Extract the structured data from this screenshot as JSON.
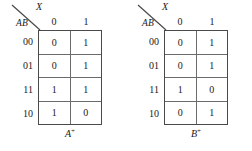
{
  "figure": {
    "background_color": "#ffffff",
    "line_color": "#4a4a4a"
  },
  "maps": [
    {
      "id": "a-next",
      "corner": {
        "column_var": "X",
        "row_var": "AB"
      },
      "column_headers": [
        "0",
        "1"
      ],
      "row_labels": [
        "00",
        "01",
        "11",
        "10"
      ],
      "rows": [
        [
          "0",
          "1"
        ],
        [
          "0",
          "1"
        ],
        [
          "1",
          "1"
        ],
        [
          "1",
          "0"
        ]
      ],
      "caption": {
        "base": "A",
        "superscript": "+"
      }
    },
    {
      "id": "b-next",
      "corner": {
        "column_var": "X",
        "row_var": "AB"
      },
      "column_headers": [
        "0",
        "1"
      ],
      "row_labels": [
        "00",
        "01",
        "11",
        "10"
      ],
      "rows": [
        [
          "0",
          "1"
        ],
        [
          "0",
          "1"
        ],
        [
          "1",
          "0"
        ],
        [
          "0",
          "1"
        ]
      ],
      "caption": {
        "base": "B",
        "superscript": "+"
      }
    }
  ]
}
